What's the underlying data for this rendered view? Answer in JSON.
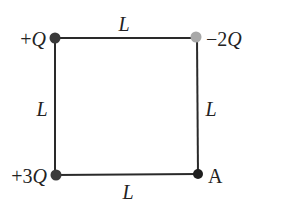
{
  "diagram": {
    "type": "square-charge-configuration",
    "sides": {
      "top": "L",
      "left": "L",
      "right": "L",
      "bottom": "L"
    },
    "corners": {
      "top_left": {
        "label": "+Q",
        "color": "#3a3a3a"
      },
      "top_right": {
        "label": "−2Q",
        "color": "#a8a8a8"
      },
      "bottom_left": {
        "label": "+3Q",
        "color": "#3a3a3a"
      },
      "bottom_right": {
        "label": "A",
        "color": "#1e1e1e"
      }
    },
    "line_color": "#2a2a2a"
  }
}
